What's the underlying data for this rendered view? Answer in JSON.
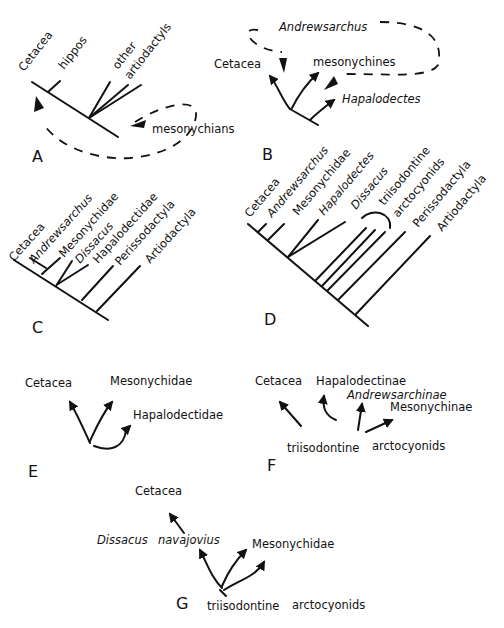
{
  "panels": {
    "A": {
      "letter": "A",
      "taxa": [
        "Cetacea",
        "hippos",
        "other",
        "artiodactyls"
      ],
      "note": "mesonychians"
    },
    "B": {
      "letter": "B",
      "taxa": [
        "Andrewsarchus",
        "Cetacea",
        "mesonychines",
        "Hapalodectes"
      ]
    },
    "C": {
      "letter": "C",
      "taxa": [
        "Cetacea",
        "Andrewsarchus",
        "Mesonychidae",
        "Dissacus",
        "Hapalodectidae",
        "Perissodactyla",
        "Artiodactyla"
      ]
    },
    "D": {
      "letter": "D",
      "taxa": [
        "Cetacea",
        "Andrewsarchus",
        "Mesonychidae",
        "Hapalodectes",
        "Dissacus",
        "triisodontine",
        "arctocyonids",
        "Perissodactyla",
        "Artiodactyla"
      ]
    },
    "E": {
      "letter": "E",
      "taxa": [
        "Cetacea",
        "Mesonychidae",
        "Hapalodectidae"
      ]
    },
    "F": {
      "letter": "F",
      "taxa": [
        "Cetacea",
        "Hapalodectinae",
        "Andrewsarchinae",
        "Mesonychinae",
        "triisodontine",
        "arctocyonids"
      ]
    },
    "G": {
      "letter": "G",
      "taxa": [
        "Cetacea",
        "Dissacus",
        "navajovius",
        "Mesonychidae",
        "triisodontine",
        "arctocyonids"
      ]
    }
  },
  "colors": {
    "ink": "#111111",
    "background": "#ffffff"
  }
}
